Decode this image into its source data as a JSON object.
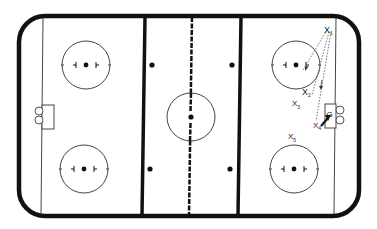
{
  "diagram": {
    "type": "hockey-rink-drill",
    "colors": {
      "ink": "#111111",
      "background": "#ffffff",
      "thin": "#444444"
    },
    "players": [
      {
        "id": "x1",
        "symbol": "X",
        "sub": "1"
      },
      {
        "id": "x2",
        "symbol": "X",
        "sub": "2"
      },
      {
        "id": "x3",
        "symbol": "X",
        "sub": "3"
      },
      {
        "id": "x4",
        "symbol": "X",
        "sub": "4"
      },
      {
        "id": "x5",
        "symbol": "X",
        "sub": "5"
      }
    ],
    "goalie": {
      "symbol": "G"
    },
    "elements": {
      "center_line": "dashed red line",
      "blue_lines": 2,
      "faceoff_circles": 5,
      "neutral_zone_dots": 4,
      "goals": 2
    }
  }
}
